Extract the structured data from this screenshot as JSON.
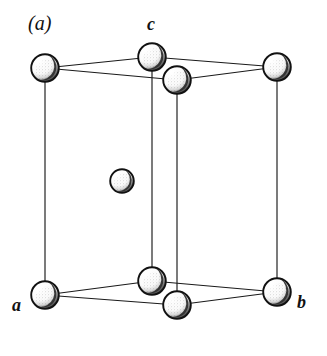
{
  "figure": {
    "panel_label": "(a)",
    "caption_absent": true,
    "background_color": "#ffffff",
    "line_color": "#1a1a1a",
    "sphere_outline_color": "#111111",
    "sphere_fill_color": "#ffffff",
    "sphere_shade_color": "#2b2b2b",
    "width": 327,
    "height": 356
  },
  "axis_labels": [
    {
      "id": "a",
      "text": "a",
      "x": 22,
      "y": 308
    },
    {
      "id": "b",
      "text": "b",
      "x": 303,
      "y": 305
    },
    {
      "id": "c",
      "text": "c",
      "x": 153,
      "y": 27
    }
  ],
  "chart_data": {
    "type": "scatter",
    "title": "(a)",
    "xlabel": "",
    "ylabel": "",
    "projection": "oblique",
    "grid": false,
    "legend": "none",
    "xlim": [
      0,
      327
    ],
    "ylim": [
      0,
      356
    ],
    "atoms": [
      {
        "name": "corner-top-left",
        "x": 45,
        "y": 68,
        "r": 15,
        "layer": "top"
      },
      {
        "name": "corner-top-back",
        "x": 152,
        "y": 57,
        "r": 15,
        "layer": "top"
      },
      {
        "name": "corner-top-right",
        "x": 277,
        "y": 67,
        "r": 15,
        "layer": "top"
      },
      {
        "name": "corner-top-front",
        "x": 177,
        "y": 80,
        "r": 15,
        "layer": "top"
      },
      {
        "name": "corner-bottom-left",
        "x": 45,
        "y": 295,
        "r": 15,
        "layer": "bottom"
      },
      {
        "name": "corner-bottom-back",
        "x": 152,
        "y": 281,
        "r": 15,
        "layer": "bottom"
      },
      {
        "name": "corner-bottom-right",
        "x": 277,
        "y": 292,
        "r": 15,
        "layer": "bottom"
      },
      {
        "name": "corner-bottom-front",
        "x": 177,
        "y": 305,
        "r": 15,
        "layer": "bottom"
      },
      {
        "name": "body-centre",
        "x": 122,
        "y": 181,
        "r": 13,
        "layer": "centre"
      }
    ],
    "edges": [
      {
        "name": "top-left-to-back",
        "x1": 45,
        "y1": 68,
        "x2": 152,
        "y2": 57
      },
      {
        "name": "top-back-to-right",
        "x1": 152,
        "y1": 57,
        "x2": 277,
        "y2": 67
      },
      {
        "name": "top-left-to-front",
        "x1": 45,
        "y1": 68,
        "x2": 177,
        "y2": 80
      },
      {
        "name": "top-front-to-right",
        "x1": 177,
        "y1": 80,
        "x2": 277,
        "y2": 67
      },
      {
        "name": "bot-left-to-back",
        "x1": 45,
        "y1": 295,
        "x2": 152,
        "y2": 281
      },
      {
        "name": "bot-back-to-right",
        "x1": 152,
        "y1": 281,
        "x2": 277,
        "y2": 292
      },
      {
        "name": "bot-left-to-front",
        "x1": 45,
        "y1": 295,
        "x2": 177,
        "y2": 305
      },
      {
        "name": "bot-front-to-right",
        "x1": 177,
        "y1": 305,
        "x2": 277,
        "y2": 292
      },
      {
        "name": "vert-left",
        "x1": 45,
        "y1": 68,
        "x2": 45,
        "y2": 295
      },
      {
        "name": "vert-back",
        "x1": 152,
        "y1": 57,
        "x2": 152,
        "y2": 281
      },
      {
        "name": "vert-front",
        "x1": 177,
        "y1": 80,
        "x2": 177,
        "y2": 305
      },
      {
        "name": "vert-right",
        "x1": 277,
        "y1": 67,
        "x2": 277,
        "y2": 292
      }
    ]
  }
}
